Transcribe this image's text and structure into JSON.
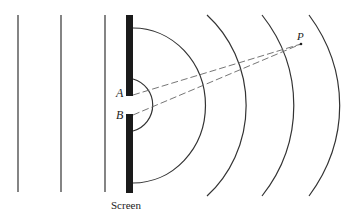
{
  "diagram": {
    "labels": {
      "slit_a": "A",
      "slit_b": "B",
      "point_p": "P",
      "screen": "Screen"
    },
    "colors": {
      "line": "#333333",
      "screen": "#1a1a1a",
      "dashed": "#666666",
      "background": "#ffffff"
    },
    "plane_wavefronts_x": [
      18,
      61,
      105
    ],
    "circular_wavefront_radii": [
      27,
      72,
      114,
      157,
      200
    ]
  }
}
